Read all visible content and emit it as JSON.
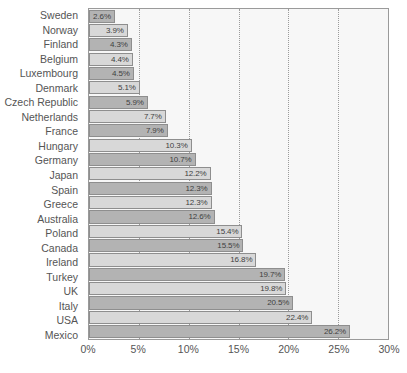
{
  "chart_data": {
    "type": "bar",
    "orientation": "horizontal",
    "title": "",
    "subtitle": "",
    "xlabel": "",
    "ylabel": "",
    "xlim": [
      0,
      30
    ],
    "xtick_labels": [
      "0%",
      "5%",
      "10%",
      "15%",
      "20%",
      "25%",
      "30%"
    ],
    "xticks": [
      0,
      5,
      10,
      15,
      20,
      25,
      30
    ],
    "grid": "vertical-dotted",
    "legend": "none",
    "value_suffix": "%",
    "categories": [
      "Sweden",
      "Norway",
      "Finland",
      "Belgium",
      "Luxembourg",
      "Denmark",
      "Czech Republic",
      "Netherlands",
      "France",
      "Hungary",
      "Germany",
      "Japan",
      "Spain",
      "Greece",
      "Australia",
      "Poland",
      "Canada",
      "Ireland",
      "Turkey",
      "UK",
      "Italy",
      "USA",
      "Mexico"
    ],
    "values": [
      2.6,
      3.9,
      4.3,
      4.4,
      4.5,
      5.1,
      5.9,
      7.7,
      7.9,
      10.3,
      10.7,
      12.2,
      12.3,
      12.3,
      12.6,
      15.4,
      15.5,
      16.8,
      19.7,
      19.8,
      20.5,
      22.4,
      26.2
    ],
    "data_labels": [
      "2.6%",
      "3.9%",
      "4.3%",
      "4.4%",
      "4.5%",
      "5.1%",
      "5.9%",
      "7.7%",
      "7.9%",
      "10.3%",
      "10.7%",
      "12.2%",
      "12.3%",
      "12.3%",
      "12.6%",
      "15.4%",
      "15.5%",
      "16.8%",
      "19.7%",
      "19.8%",
      "20.5%",
      "22.4%",
      "26.2%"
    ],
    "colors": {
      "bar_dark": "#b3b3b3",
      "bar_light": "#d8d8d8",
      "bar_border": "#8e8e8e",
      "plot_background": "#f7f7f7",
      "plot_border": "#9a9a9a",
      "gridline": "#9b9b9b",
      "label_text": "#555555",
      "value_text": "#3f3f3f"
    }
  }
}
